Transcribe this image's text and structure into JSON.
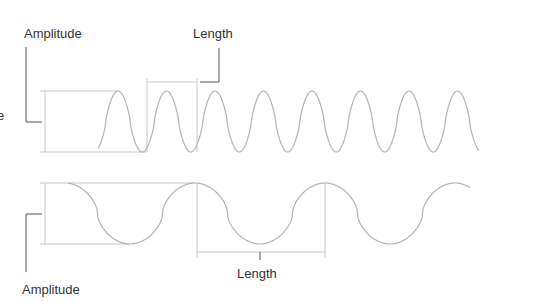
{
  "diagram": {
    "waves": [
      {
        "name": "high-frequency-wave",
        "description": "Short wavelength, same amplitude",
        "cycles_shown": 7,
        "amplitude_label": "Amplitude",
        "length_label": "Length"
      },
      {
        "name": "low-frequency-wave",
        "description": "Long wavelength, same amplitude",
        "cycles_shown": 3,
        "amplitude_label": "Amplitude",
        "length_label": "Length"
      }
    ],
    "cropped_left_text": [
      "e"
    ],
    "colors": {
      "wave": "#b4b4b4",
      "guide": "#c8c8c8",
      "leader": "#555555",
      "text": "#333333"
    }
  }
}
